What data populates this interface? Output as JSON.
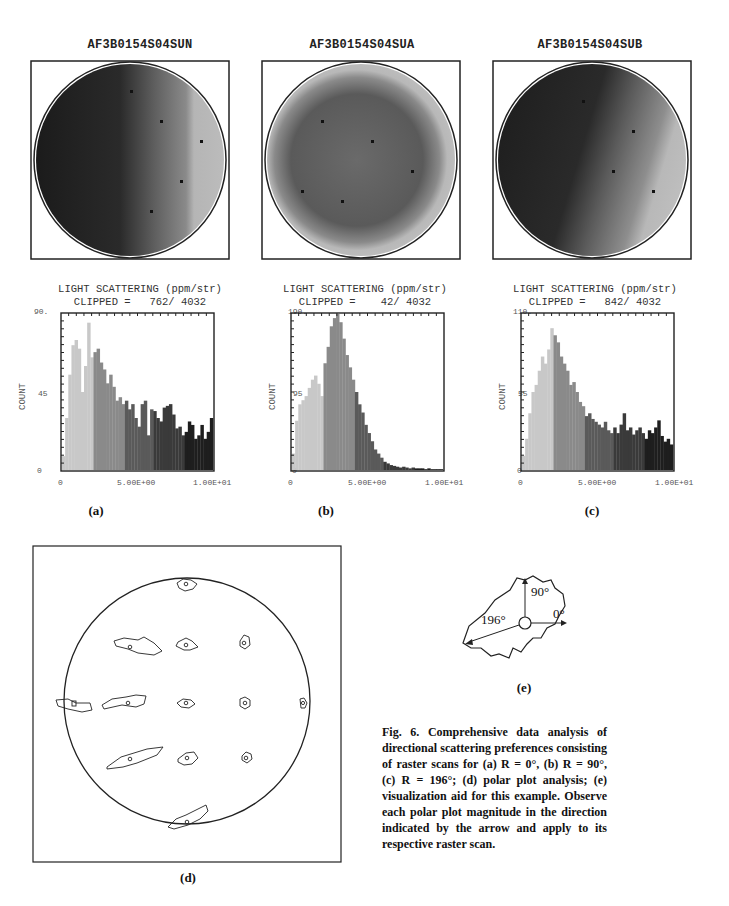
{
  "figure": {
    "number": "Fig. 6.",
    "caption": "Fig. 6.  Comprehensive data analysis of directional scattering preferences consisting of raster scans for (a) R = 0°, (b) R = 90°, (c) R = 196°; (d) polar plot analysis; (e) visualization aid for this example.  Observe each polar plot magnitude in the direction indicated by the arrow and apply to its respective raster scan.",
    "panel_labels": {
      "a": "(a)",
      "b": "(b)",
      "c": "(c)",
      "d": "(d)",
      "e": "(e)"
    }
  },
  "raster_scans": [
    {
      "id": "a",
      "title": "AF3B0154S04SUN",
      "rotation_deg": 0
    },
    {
      "id": "b",
      "title": "AF3B0154S04SUA",
      "rotation_deg": 90
    },
    {
      "id": "c",
      "title": "AF3B0154S04SUB",
      "rotation_deg": 196
    }
  ],
  "histograms": [
    {
      "id": "a",
      "title": "LIGHT SCATTERING (ppm/str)",
      "clipped": "CLIPPED =   762/ 4032",
      "ymax_label": "90.",
      "ymid_label": "45",
      "ymin_label": "0",
      "ylabel": "COUNT",
      "xticks": [
        "0",
        "5.00E+00",
        "1.00E+01"
      ]
    },
    {
      "id": "b",
      "title": "LIGHT SCATTERING (ppm/str)",
      "clipped": "CLIPPED =    42/ 4032",
      "ymax_label": "190.",
      "ymid_label": "95",
      "ymin_label": "0",
      "ylabel": "COUNT",
      "xticks": [
        "0",
        "5.00E+00",
        "1.00E+01"
      ]
    },
    {
      "id": "c",
      "title": "LIGHT SCATTERING (ppm/str)",
      "clipped": "CLIPPED =   842/ 4032",
      "ymax_label": "110.",
      "ymid_label": "55",
      "ymin_label": "0",
      "ylabel": "COUNT",
      "xticks": [
        "0",
        "5.00E+00",
        "1.00E+01"
      ]
    }
  ],
  "visual_aid": {
    "angle_labels": [
      "90°",
      "0°",
      "196°"
    ]
  },
  "chart_data": [
    {
      "type": "bar",
      "title": "LIGHT SCATTERING (ppm/str)",
      "subtitle": "CLIPPED = 762/ 4032",
      "panel": "(a)",
      "xlabel": "",
      "ylabel": "COUNT",
      "xlim": [
        0,
        10
      ],
      "ylim": [
        0,
        90
      ],
      "xticks": [
        "0",
        "5.00E+00",
        "1.00E+01"
      ],
      "grid": false,
      "bin_width": 0.2,
      "values": [
        8,
        30,
        55,
        72,
        75,
        70,
        45,
        60,
        85,
        65,
        68,
        70,
        62,
        58,
        50,
        55,
        48,
        40,
        42,
        38,
        40,
        35,
        38,
        30,
        25,
        38,
        40,
        20,
        35,
        34,
        30,
        28,
        36,
        37,
        38,
        32,
        24,
        25,
        20,
        22,
        28,
        26,
        18,
        20,
        26,
        18,
        22,
        30
      ]
    },
    {
      "type": "bar",
      "title": "LIGHT SCATTERING (ppm/str)",
      "subtitle": "CLIPPED = 42/ 4032",
      "panel": "(b)",
      "xlabel": "",
      "ylabel": "COUNT",
      "xlim": [
        0,
        10
      ],
      "ylim": [
        0,
        190
      ],
      "xticks": [
        "0",
        "5.00E+00",
        "1.00E+01"
      ],
      "grid": false,
      "bin_width": 0.2,
      "values": [
        20,
        60,
        80,
        85,
        90,
        100,
        110,
        115,
        105,
        90,
        130,
        150,
        175,
        185,
        190,
        180,
        160,
        140,
        125,
        110,
        95,
        80,
        70,
        55,
        45,
        35,
        25,
        20,
        15,
        10,
        8,
        6,
        5,
        4,
        3,
        4,
        3,
        2,
        3,
        2,
        2,
        2,
        1,
        2,
        1,
        1,
        1,
        1
      ]
    },
    {
      "type": "bar",
      "title": "LIGHT SCATTERING (ppm/str)",
      "subtitle": "CLIPPED = 842/ 4032",
      "panel": "(c)",
      "xlabel": "",
      "ylabel": "COUNT",
      "xlim": [
        0,
        10
      ],
      "ylim": [
        0,
        110
      ],
      "xticks": [
        "0",
        "5.00E+00",
        "1.00E+01"
      ],
      "grid": false,
      "bin_width": 0.2,
      "values": [
        10,
        22,
        40,
        55,
        60,
        70,
        80,
        75,
        85,
        100,
        95,
        90,
        80,
        75,
        70,
        60,
        62,
        55,
        48,
        45,
        38,
        40,
        36,
        34,
        32,
        30,
        34,
        28,
        26,
        30,
        26,
        32,
        40,
        28,
        30,
        25,
        28,
        30,
        26,
        22,
        28,
        26,
        30,
        35,
        24,
        20,
        22,
        18
      ]
    },
    {
      "type": "scatter",
      "panel": "(d)",
      "title": "polar plot analysis",
      "points_note": "polar glyphs at grid positions inside wafer circle",
      "x": [
        0,
        -1,
        0,
        1,
        -2.1,
        -1,
        0,
        1,
        2.1,
        -1,
        0,
        1,
        0
      ],
      "y": [
        2.1,
        1,
        1,
        1,
        0,
        0,
        0,
        0,
        0,
        -1,
        -1,
        -1,
        -2.1
      ]
    }
  ]
}
